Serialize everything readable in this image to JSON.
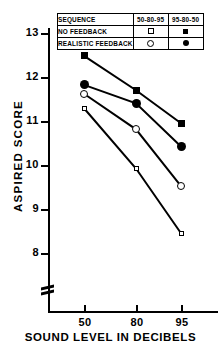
{
  "chart_data": {
    "type": "line",
    "title": "",
    "xlabel": "SOUND LEVEL IN DECIBELS",
    "ylabel": "ASPIRED SCORE",
    "x": [
      50,
      80,
      95
    ],
    "xtick_labels": [
      "50",
      "80",
      "95"
    ],
    "ytick_labels": [
      "8",
      "9",
      "10",
      "11",
      "12",
      "13"
    ],
    "ylim": [
      7.6,
      13.3
    ],
    "grid": false,
    "axis_break": true,
    "legend_position": "top-center",
    "series": [
      {
        "name": "NO FEEDBACK 95-80-50",
        "marker": "filled-square",
        "values": [
          12.48,
          11.7,
          10.95
        ]
      },
      {
        "name": "REALISTIC FEEDBACK 95-80-50",
        "marker": "filled-circle",
        "values": [
          11.82,
          11.4,
          10.42
        ]
      },
      {
        "name": "REALISTIC FEEDBACK 50-80-95",
        "marker": "open-circle",
        "values": [
          11.62,
          10.81,
          9.52
        ]
      },
      {
        "name": "NO FEEDBACK 50-80-95",
        "marker": "open-square",
        "values": [
          11.29,
          9.92,
          8.45
        ]
      }
    ]
  },
  "legend": {
    "header_label": "SEQUENCE",
    "col1": "50-80-95",
    "col2": "95-80-50",
    "row1": "NO FEEDBACK",
    "row2": "REALISTIC FEEDBACK"
  },
  "axes": {
    "ylabel": "ASPIRED SCORE",
    "xlabel": "SOUND LEVEL IN DECIBELS",
    "yticks": [
      "13",
      "12",
      "11",
      "10",
      "9",
      "8"
    ],
    "xticks": [
      "50",
      "80",
      "95"
    ]
  },
  "colors": {
    "ink": "#000000",
    "background": "#ffffff"
  }
}
